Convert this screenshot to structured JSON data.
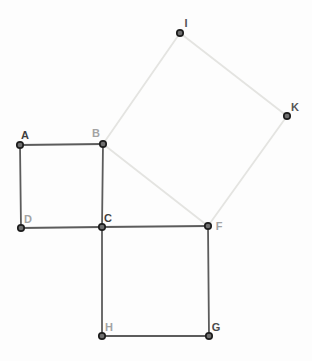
{
  "app": {
    "description": "Geometry construction of three squares illustrating the Pythagorean theorem: small square ABCD, large square CFGH, and a tilted square BIKF built on the shared hypotenuse BF."
  },
  "canvas": {
    "width": 312,
    "height": 361,
    "background": "#fdfdfd"
  },
  "styles": {
    "dark_edge_color": "#5c5c5c",
    "light_edge_color": "#e4e4e1",
    "edge_width": 1.8,
    "point_fill": "#6f6f6f",
    "point_stroke": "#1d1d1d",
    "point_stroke_width": 1.7,
    "point_radius": 3.2,
    "label_font_size": 11
  },
  "diagram": {
    "points": [
      {
        "id": "A",
        "x": 20,
        "y": 145,
        "label": {
          "text": "A",
          "x": 25,
          "y": 139,
          "color": "#3f3f3f"
        }
      },
      {
        "id": "B",
        "x": 103,
        "y": 144,
        "label": {
          "text": "B",
          "x": 96,
          "y": 137,
          "color": "#a3a3a3"
        }
      },
      {
        "id": "C",
        "x": 102,
        "y": 227,
        "label": {
          "text": "C",
          "x": 108,
          "y": 222,
          "color": "#3f3f3f"
        }
      },
      {
        "id": "D",
        "x": 21,
        "y": 228,
        "label": {
          "text": "D",
          "x": 28,
          "y": 223,
          "color": "#a3a3a3"
        }
      },
      {
        "id": "F",
        "x": 208,
        "y": 226,
        "label": {
          "text": "F",
          "x": 219,
          "y": 230,
          "color": "#a3a3a3"
        }
      },
      {
        "id": "G",
        "x": 209,
        "y": 336,
        "label": {
          "text": "G",
          "x": 216,
          "y": 331,
          "color": "#4a4a4a"
        }
      },
      {
        "id": "H",
        "x": 102,
        "y": 336,
        "label": {
          "text": "H",
          "x": 109,
          "y": 331,
          "color": "#a3a3a3"
        }
      },
      {
        "id": "I",
        "x": 180,
        "y": 33,
        "label": {
          "text": "I",
          "x": 186,
          "y": 27,
          "color": "#555555"
        }
      },
      {
        "id": "K",
        "x": 287,
        "y": 116,
        "label": {
          "text": "K",
          "x": 295,
          "y": 111,
          "color": "#555555"
        }
      }
    ],
    "edges": [
      {
        "from": "B",
        "to": "I",
        "tone": "light"
      },
      {
        "from": "I",
        "to": "K",
        "tone": "light"
      },
      {
        "from": "K",
        "to": "F",
        "tone": "light"
      },
      {
        "from": "F",
        "to": "B",
        "tone": "light"
      },
      {
        "from": "A",
        "to": "B",
        "tone": "dark"
      },
      {
        "from": "B",
        "to": "C",
        "tone": "dark"
      },
      {
        "from": "C",
        "to": "D",
        "tone": "dark"
      },
      {
        "from": "D",
        "to": "A",
        "tone": "dark"
      },
      {
        "from": "C",
        "to": "F",
        "tone": "dark"
      },
      {
        "from": "F",
        "to": "G",
        "tone": "dark"
      },
      {
        "from": "G",
        "to": "H",
        "tone": "dark"
      },
      {
        "from": "H",
        "to": "C",
        "tone": "dark"
      }
    ]
  }
}
